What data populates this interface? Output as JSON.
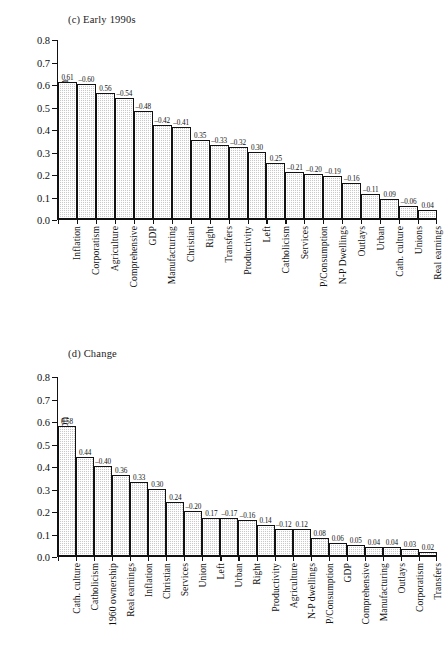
{
  "figure_c": {
    "title": "(c) Early 1990s",
    "ylabel": "Correlation"
  },
  "figure_d": {
    "title": "(d) Change",
    "ylabel": "Correlation"
  },
  "chart_data": [
    {
      "type": "bar",
      "title": "(c) Early 1990s",
      "xlabel": "",
      "ylabel": "Correlation",
      "ylim": [
        0.0,
        0.8
      ],
      "ytick_labels": [
        "0.0",
        "0.1",
        "0.2",
        "0.3",
        "0.4",
        "0.5",
        "0.6",
        "0.7",
        "0.8"
      ],
      "yticks": [
        0.0,
        0.1,
        0.2,
        0.3,
        0.4,
        0.5,
        0.6,
        0.7,
        0.8
      ],
      "grid": false,
      "legend": "none",
      "categories": [
        "Inflation",
        "Corporatism",
        "Agriculture",
        "Comprehensive",
        "GDP",
        "Manufacturing",
        "Christian",
        "Right",
        "Transfers",
        "Productivity",
        "Left",
        "Catholicism",
        "Services",
        "P/Consumption",
        "N-P Dwellings",
        "Outlays",
        "Urban",
        "Cath. culture",
        "Unions",
        "Real earnings"
      ],
      "values": [
        0.61,
        0.6,
        0.56,
        0.54,
        0.48,
        0.42,
        0.41,
        0.35,
        0.33,
        0.32,
        0.3,
        0.25,
        0.21,
        0.2,
        0.19,
        0.16,
        0.11,
        0.09,
        0.06,
        0.04
      ],
      "data_labels": [
        "0.61",
        "–0.60",
        "0.56",
        "–0.54",
        "–0.48",
        "–0.42",
        "–0.41",
        "0.35",
        "–0.33",
        "–0.32",
        "0.30",
        "0.25",
        "–0.21",
        "–0.20",
        "–0.19",
        "–0.16",
        "–0.11",
        "0.09",
        "–0.06",
        "0.04"
      ]
    },
    {
      "type": "bar",
      "title": "(d) Change",
      "xlabel": "",
      "ylabel": "Correlation",
      "ylim": [
        0.0,
        0.8
      ],
      "ytick_labels": [
        "0.0",
        "0.1",
        "0.2",
        "0.3",
        "0.4",
        "0.5",
        "0.6",
        "0.7",
        "0.8"
      ],
      "yticks": [
        0.0,
        0.1,
        0.2,
        0.3,
        0.4,
        0.5,
        0.6,
        0.7,
        0.8
      ],
      "grid": false,
      "legend": "none",
      "categories": [
        "Cath. culture",
        "Catholicism",
        "1960 ownership",
        "Real earnings",
        "Inflation",
        "Christian",
        "Services",
        "Union",
        "Left",
        "Urban",
        "Right",
        "Productivity",
        "Agriculture",
        "N-P dwellings",
        "P/Consumption",
        "GDP",
        "Comprehensive",
        "Manufacturing",
        "Outlays",
        "Corporatism",
        "Transfers"
      ],
      "values": [
        0.58,
        0.44,
        0.4,
        0.36,
        0.33,
        0.3,
        0.24,
        0.2,
        0.17,
        0.17,
        0.16,
        0.14,
        0.12,
        0.12,
        0.08,
        0.06,
        0.05,
        0.04,
        0.04,
        0.03,
        0.02
      ],
      "data_labels": [
        "0.58",
        "0.44",
        "–0.40",
        "0.36",
        "0.33",
        "0.30",
        "0.24",
        "–0.20",
        "0.17",
        "–0.17",
        "–0.16",
        "0.14",
        "–0.12",
        "0.12",
        "0.08",
        "0.06",
        "0.05",
        "0.04",
        "0.04",
        "0.03",
        "0.02"
      ]
    }
  ]
}
